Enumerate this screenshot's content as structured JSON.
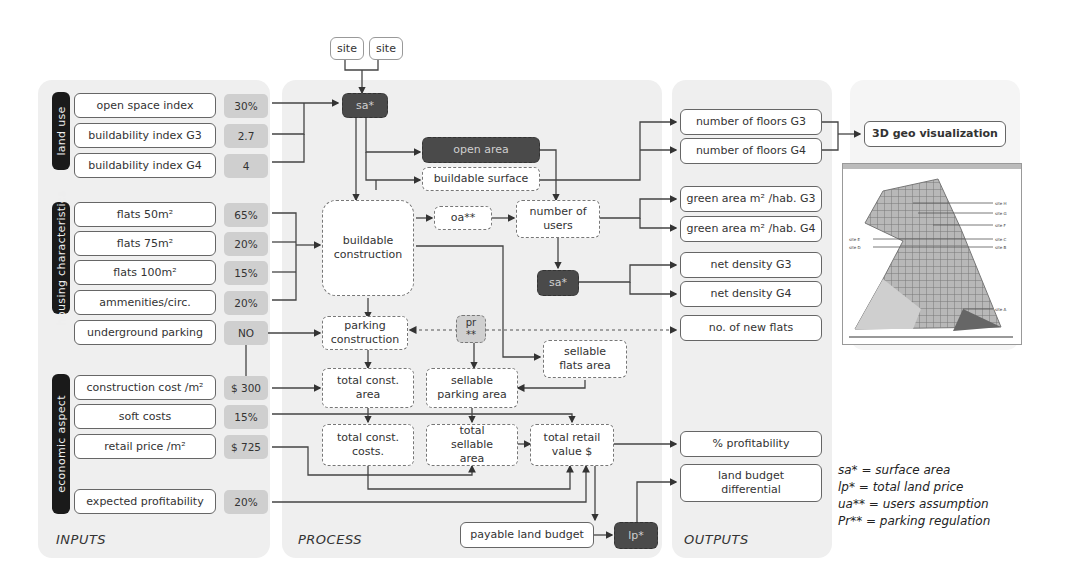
{
  "top": {
    "site_left": "site",
    "site_right": "site"
  },
  "sections": {
    "inputs": "INPUTS",
    "process": "PROCESS",
    "outputs": "OUTPUTS"
  },
  "inputs": {
    "groups": {
      "land_use": "land use",
      "housing": "housing characteristics",
      "economic": "economic aspect"
    },
    "rows": [
      {
        "label": "open space index",
        "value": "30%"
      },
      {
        "label": "buildability index G3",
        "value": "2.7"
      },
      {
        "label": "buildability index G4",
        "value": "4"
      },
      {
        "label": "flats 50m²",
        "value": "65%"
      },
      {
        "label": "flats 75m²",
        "value": "20%"
      },
      {
        "label": "flats 100m²",
        "value": "15%"
      },
      {
        "label": "ammenities/circ.",
        "value": "20%"
      },
      {
        "label": "underground parking",
        "value": "NO"
      },
      {
        "label": "construction cost /m²",
        "value": "$ 300"
      },
      {
        "label": "soft costs",
        "value": "15%"
      },
      {
        "label": "retail price /m²",
        "value": "$ 725"
      },
      {
        "label": "expected profitability",
        "value": "20%"
      }
    ]
  },
  "process": {
    "sa_top": "sa*",
    "open_area": "open area",
    "buildable_surface": "buildable surface",
    "buildable_construction": "buildable construction",
    "oa": "oa**",
    "number_of_users": "number of users",
    "sa_mid": "sa*",
    "pr": "pr **",
    "parking_construction": "parking construction",
    "sellable_flats_area": "sellable flats area",
    "total_const_area": "total const. area",
    "sellable_parking_area": "sellable parking area",
    "total_const_costs": "total const. costs.",
    "total_sellable_area": "total sellable area",
    "total_retail_value": "total retail value $",
    "payable_land_budget": "payable land budget",
    "lp": "lp*"
  },
  "outputs": {
    "items": [
      "number of floors G3",
      "number of floors G4",
      "green area m² /hab. G3",
      "green area m² /hab. G4",
      "net density G3",
      "net density G4",
      "no. of new flats",
      "% profitability",
      "land budget differential"
    ]
  },
  "visualization": {
    "title": "3D geo visualization",
    "map_labels_right": [
      "site H",
      "site G",
      "site F",
      "site C",
      "site B",
      "site A"
    ],
    "map_labels_left": [
      "site E",
      "site D"
    ]
  },
  "legend": [
    "sa* = surface area",
    "lp* = total land price",
    "ua** =  users assumption",
    "Pr** = parking regulation"
  ]
}
